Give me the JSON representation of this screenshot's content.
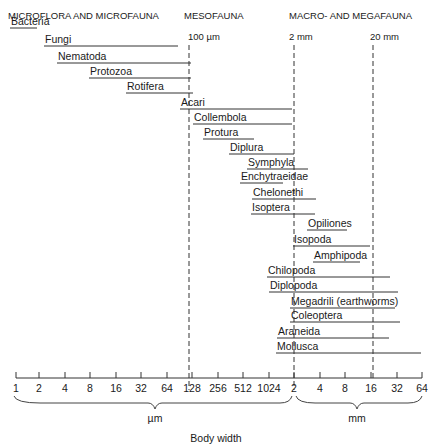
{
  "chart_data": {
    "type": "range-bar",
    "title": "",
    "xlabel": "Body width",
    "x_scale": "log2",
    "x_ticks": [
      "1",
      "2",
      "4",
      "8",
      "16",
      "32",
      "64",
      "128",
      "256",
      "512",
      "1024",
      "2",
      "4",
      "8",
      "16",
      "32",
      "64"
    ],
    "x_tick_units": {
      "um_range": [
        "1",
        "1024"
      ],
      "mm_range": [
        "2",
        "64"
      ]
    },
    "unit_labels": {
      "um": "µm",
      "mm": "mm"
    },
    "category_headers": [
      {
        "label": "MICROFLORA AND MICROFAUNA",
        "x": 10
      },
      {
        "label": "MESOFAUNA",
        "x": 184
      },
      {
        "label": "MACRO- AND MEGAFAUNA",
        "x": 289
      }
    ],
    "reference_lines": [
      {
        "label": "100 µm",
        "x": 189
      },
      {
        "label": "2 mm",
        "x": 294
      },
      {
        "label": "20 mm",
        "x": 373
      }
    ],
    "groups": [
      {
        "name": "Bacteria",
        "min_um": 1,
        "max_um": 3,
        "x0": 10,
        "x1": 37,
        "y": 28
      },
      {
        "name": "Fungi",
        "min_um": 2,
        "max_um": 100,
        "x0": 44,
        "x1": 178,
        "y": 46
      },
      {
        "name": "Nematoda",
        "min_um": 3,
        "max_um": 120,
        "x0": 57,
        "x1": 191,
        "y": 63
      },
      {
        "name": "Protozoa",
        "min_um": 6,
        "max_um": 120,
        "x0": 89,
        "x1": 191,
        "y": 78
      },
      {
        "name": "Rotifera",
        "min_um": 16,
        "max_um": 125,
        "x0": 126,
        "x1": 193,
        "y": 93
      },
      {
        "name": "Acari",
        "min_um": 80,
        "max_um": 1900,
        "x0": 180,
        "x1": 292,
        "y": 109
      },
      {
        "name": "Collembola",
        "min_um": 125,
        "max_um": 1900,
        "x0": 193,
        "x1": 292,
        "y": 124
      },
      {
        "name": "Protura",
        "min_um": 160,
        "max_um": 700,
        "x0": 203,
        "x1": 254,
        "y": 139
      },
      {
        "name": "Diplura",
        "min_um": 400,
        "max_um": 2000,
        "x0": 229,
        "x1": 294,
        "y": 154
      },
      {
        "name": "Symphyla",
        "min_um": 650,
        "max_um": 3000,
        "x0": 247,
        "x1": 308,
        "y": 169
      },
      {
        "name": "Enchytraeidae",
        "min_um": 550,
        "max_um": 1700,
        "x0": 240,
        "x1": 283,
        "y": 183
      },
      {
        "name": "Chelonethi",
        "min_um": 800,
        "max_um": 3800,
        "x0": 252,
        "x1": 316,
        "y": 199
      },
      {
        "name": "Isoptera",
        "min_um": 750,
        "max_um": 3700,
        "x0": 251,
        "x1": 315,
        "y": 214
      },
      {
        "name": "Opiliones",
        "min_um": 3000,
        "max_um": 8000,
        "x0": 307,
        "x1": 347,
        "y": 230
      },
      {
        "name": "Isopoda",
        "min_um": 2000,
        "max_um": 15000,
        "x0": 293,
        "x1": 370,
        "y": 246
      },
      {
        "name": "Amphipoda",
        "min_um": 3500,
        "max_um": 12000,
        "x0": 313,
        "x1": 360,
        "y": 262
      },
      {
        "name": "Chilopoda",
        "min_um": 1200,
        "max_um": 24000,
        "x0": 267,
        "x1": 390,
        "y": 277
      },
      {
        "name": "Diplopoda",
        "min_um": 1300,
        "max_um": 30000,
        "x0": 269,
        "x1": 398,
        "y": 292
      },
      {
        "name": "Megadrili (earthworms)",
        "min_um": 1900,
        "max_um": 28000,
        "x0": 290,
        "x1": 395,
        "y": 308
      },
      {
        "name": "Coleoptera",
        "min_um": 1900,
        "max_um": 32000,
        "x0": 290,
        "x1": 400,
        "y": 322
      },
      {
        "name": "Araneida",
        "min_um": 1400,
        "max_um": 23000,
        "x0": 277,
        "x1": 389,
        "y": 338
      },
      {
        "name": "Mollusca",
        "min_um": 1400,
        "max_um": 64000,
        "x0": 276,
        "x1": 421,
        "y": 353
      }
    ],
    "legend": null,
    "grid": false
  },
  "labels": {
    "header_micro": "MICROFLORA AND MICROFAUNA",
    "header_meso": "MESOFAUNA",
    "header_macro": "MACRO- AND MEGAFAUNA",
    "ref_100um": "100 µm",
    "ref_2mm": "2 mm",
    "ref_20mm": "20 mm",
    "unit_um": "µm",
    "unit_mm": "mm",
    "xlabel": "Body width"
  },
  "ticks": [
    {
      "label": "1",
      "x": 16
    },
    {
      "label": "2",
      "x": 39
    },
    {
      "label": "4",
      "x": 65
    },
    {
      "label": "8",
      "x": 90
    },
    {
      "label": "16",
      "x": 116
    },
    {
      "label": "32",
      "x": 141
    },
    {
      "label": "64",
      "x": 167
    },
    {
      "label": "128",
      "x": 192
    },
    {
      "label": "256",
      "x": 218
    },
    {
      "label": "512",
      "x": 243
    },
    {
      "label": "1024",
      "x": 269
    },
    {
      "label": "2",
      "x": 294
    },
    {
      "label": "4",
      "x": 320
    },
    {
      "label": "8",
      "x": 345
    },
    {
      "label": "16",
      "x": 371
    },
    {
      "label": "32",
      "x": 397
    },
    {
      "label": "64",
      "x": 422
    }
  ]
}
